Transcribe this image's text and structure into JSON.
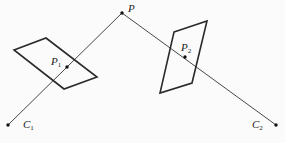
{
  "diagram": {
    "colors": {
      "line": "#333333",
      "plane": "#2a2a2a",
      "point": "#111111",
      "background": "#fbfbfb"
    },
    "points": [
      {
        "id": "P",
        "label": "P",
        "sub": "",
        "x": 122,
        "y": 13,
        "lx": 128,
        "ly": 12
      },
      {
        "id": "C1",
        "label": "C",
        "sub": "1",
        "x": 8,
        "y": 125,
        "lx": 23,
        "ly": 128
      },
      {
        "id": "C2",
        "label": "C",
        "sub": "2",
        "x": 276,
        "y": 125,
        "lx": 252,
        "ly": 128
      },
      {
        "id": "P1",
        "label": "P",
        "sub": "1",
        "x": 67,
        "y": 67,
        "lx": 51,
        "ly": 65
      },
      {
        "id": "P2",
        "label": "P",
        "sub": "2",
        "x": 185,
        "y": 57,
        "lx": 181,
        "ly": 51
      }
    ],
    "rays": [
      {
        "from": "C1",
        "to": "P"
      },
      {
        "from": "P",
        "to": "C2"
      }
    ],
    "image_planes": [
      {
        "id": "plane-1",
        "points": "14,50 46,38 97,77 64,89"
      },
      {
        "id": "plane-2",
        "points": "174,32 207,21 192,83 160,93"
      }
    ]
  }
}
